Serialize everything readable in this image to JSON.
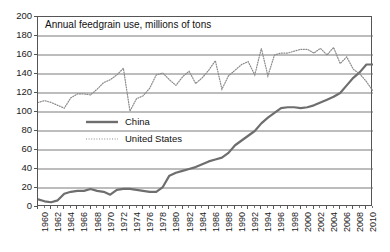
{
  "chart_data": {
    "type": "line",
    "title": "Annual feedgrain use, millions of tons",
    "xlabel": "",
    "ylabel": "",
    "ylim": [
      0,
      200
    ],
    "ytick_step": 20,
    "yticks": [
      0,
      20,
      40,
      60,
      80,
      100,
      120,
      140,
      160,
      180,
      200
    ],
    "xlim": [
      1960,
      2011
    ],
    "xticks": [
      1960,
      1962,
      1964,
      1966,
      1968,
      1970,
      1972,
      1974,
      1976,
      1978,
      1980,
      1982,
      1984,
      1986,
      1988,
      1990,
      1992,
      1994,
      1996,
      1998,
      2000,
      2002,
      2004,
      2006,
      2008,
      2010
    ],
    "grid": "horizontal",
    "legend_position": "center-left",
    "x": [
      1960,
      1961,
      1962,
      1963,
      1964,
      1965,
      1966,
      1967,
      1968,
      1969,
      1970,
      1971,
      1972,
      1973,
      1974,
      1975,
      1976,
      1977,
      1978,
      1979,
      1980,
      1981,
      1982,
      1983,
      1984,
      1985,
      1986,
      1987,
      1988,
      1989,
      1990,
      1991,
      1992,
      1993,
      1994,
      1995,
      1996,
      1997,
      1998,
      1999,
      2000,
      2001,
      2002,
      2003,
      2004,
      2005,
      2006,
      2007,
      2008,
      2009,
      2010,
      2011
    ],
    "series": [
      {
        "name": "China",
        "style": "solid",
        "color": "#6e6e6e",
        "values": [
          8,
          6,
          5,
          7,
          14,
          16,
          17,
          17,
          19,
          17,
          16,
          13,
          18,
          19,
          19,
          18,
          17,
          16,
          16,
          21,
          33,
          36,
          38,
          40,
          42,
          45,
          48,
          50,
          52,
          57,
          65,
          70,
          75,
          80,
          88,
          94,
          99,
          104,
          105,
          105,
          104,
          105,
          107,
          110,
          113,
          116,
          120,
          128,
          136,
          142,
          150,
          150
        ]
      },
      {
        "name": "United States",
        "style": "dotted",
        "color": "#8a8a8a",
        "values": [
          110,
          112,
          110,
          107,
          104,
          115,
          119,
          119,
          118,
          124,
          131,
          134,
          139,
          146,
          101,
          114,
          117,
          125,
          139,
          141,
          134,
          128,
          137,
          143,
          130,
          136,
          144,
          154,
          124,
          138,
          144,
          150,
          153,
          139,
          167,
          138,
          160,
          162,
          162,
          164,
          166,
          166,
          162,
          167,
          160,
          168,
          151,
          158,
          145,
          140,
          132,
          122
        ]
      }
    ]
  }
}
